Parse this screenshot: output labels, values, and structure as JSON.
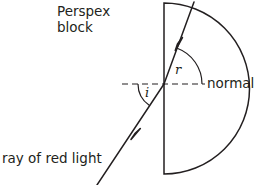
{
  "diagram": {
    "background_color": "#ffffff",
    "ink_color": "#231f20",
    "labels": {
      "block": "Perspex\nblock",
      "normal": "normal",
      "incident_ray": "ray of red light",
      "angle_of_incidence": "i",
      "angle_of_refraction": "r"
    },
    "geometry": {
      "block_shape": "semicircle",
      "flat_edge_x": 164,
      "flat_edge_top_y": 3,
      "flat_edge_bottom_y": 174,
      "arc_center": [
        164,
        88.5
      ],
      "arc_radius": 85,
      "arc_leftmost_x": 79,
      "normal_line": {
        "style": "dashed",
        "y": 84,
        "x_start": 122,
        "x_end": 205
      },
      "incident_ray": {
        "from": [
          97,
          185
        ],
        "to": [
          164,
          84
        ],
        "arrow_at": [
          137,
          133
        ]
      },
      "refracted_ray": {
        "from": [
          164,
          84
        ],
        "to": [
          194,
          2
        ],
        "arrow_at": [
          180,
          44
        ]
      },
      "angle_arc_i": {
        "vertex": [
          164,
          84
        ],
        "radius": 26,
        "between": [
          "normal-left",
          "incident-ray"
        ]
      },
      "angle_arc_r": {
        "vertex": [
          164,
          84
        ],
        "radius": 38,
        "between": [
          "refracted-ray",
          "normal-right"
        ]
      }
    }
  }
}
